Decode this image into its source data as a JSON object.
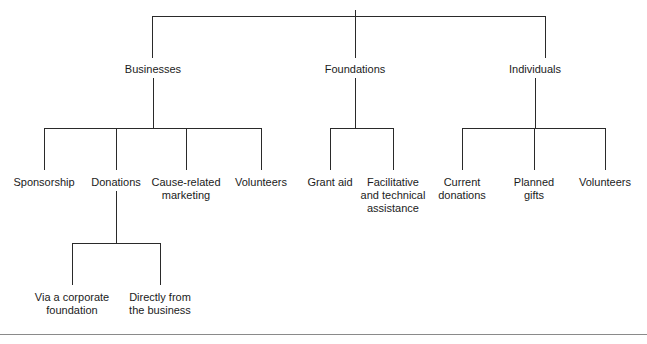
{
  "diagram": {
    "type": "organizational-tree",
    "title": "",
    "orientation": "top-down",
    "line_color": "#2a2a2a",
    "text_color": "#1b1b1b",
    "background_color": "#ffffff",
    "footer_rule_color": "#8a8a8a",
    "levels": 4
  },
  "nodes": {
    "level1": [
      {
        "id": "businesses",
        "label": "Businesses",
        "x": 153,
        "y": 63
      },
      {
        "id": "foundations",
        "label": "Foundations",
        "x": 355,
        "y": 63
      },
      {
        "id": "individuals",
        "label": "Individuals",
        "x": 535,
        "y": 63
      }
    ],
    "level2_businesses": [
      {
        "id": "sponsorship",
        "label": "Sponsorship",
        "x": 44,
        "y": 176
      },
      {
        "id": "donations",
        "label": "Donations",
        "x": 116,
        "y": 176
      },
      {
        "id": "cause-related-marketing",
        "label": "Cause-related\nmarketing",
        "x": 186,
        "y": 176
      },
      {
        "id": "volunteers-business",
        "label": "Volunteers",
        "x": 261,
        "y": 176
      }
    ],
    "level2_foundations": [
      {
        "id": "grant-aid",
        "label": "Grant aid",
        "x": 330,
        "y": 176
      },
      {
        "id": "facilitative-and-technical-assistance",
        "label": "Facilitative\nand technical\nassistance",
        "x": 393,
        "y": 176
      }
    ],
    "level2_individuals": [
      {
        "id": "current-donations",
        "label": "Current\ndonations",
        "x": 462,
        "y": 176
      },
      {
        "id": "planned-gifts",
        "label": "Planned\ngifts",
        "x": 534,
        "y": 176
      },
      {
        "id": "volunteers-individual",
        "label": "Volunteers",
        "x": 605,
        "y": 176
      }
    ],
    "level3_donations": [
      {
        "id": "via-a-corporate-foundation",
        "label": "Via a corporate\nfoundation",
        "x": 72,
        "y": 291
      },
      {
        "id": "directly-from-the-business",
        "label": "Directly from\nthe business",
        "x": 160,
        "y": 291
      }
    ]
  },
  "connectors": {
    "root_bar": {
      "x1": 152,
      "x2": 545,
      "y": 16
    },
    "root_stub": {
      "x": 355,
      "y1": 10,
      "y2": 16
    },
    "root_drops": [
      {
        "x": 152,
        "y1": 16,
        "y2": 58
      },
      {
        "x": 355,
        "y1": 16,
        "y2": 58
      },
      {
        "x": 545,
        "y1": 16,
        "y2": 58
      }
    ],
    "businesses_stem": {
      "x": 153,
      "y1": 78,
      "y2": 128
    },
    "businesses_bar": {
      "x1": 44,
      "x2": 261,
      "y": 128
    },
    "businesses_drops": [
      {
        "x": 44,
        "y1": 128,
        "y2": 170
      },
      {
        "x": 116,
        "y1": 128,
        "y2": 170
      },
      {
        "x": 186,
        "y1": 128,
        "y2": 170
      },
      {
        "x": 261,
        "y1": 128,
        "y2": 170
      }
    ],
    "foundations_stem": {
      "x": 355,
      "y1": 78,
      "y2": 128
    },
    "foundations_bar": {
      "x1": 330,
      "x2": 393,
      "y": 128
    },
    "foundations_drops": [
      {
        "x": 330,
        "y1": 128,
        "y2": 170
      },
      {
        "x": 393,
        "y1": 128,
        "y2": 170
      }
    ],
    "individuals_stem": {
      "x": 535,
      "y1": 78,
      "y2": 128
    },
    "individuals_bar": {
      "x1": 462,
      "x2": 605,
      "y": 128
    },
    "individuals_drops": [
      {
        "x": 462,
        "y1": 128,
        "y2": 170
      },
      {
        "x": 534,
        "y1": 128,
        "y2": 170
      },
      {
        "x": 605,
        "y1": 128,
        "y2": 170
      }
    ],
    "donations_stem": {
      "x": 116,
      "y1": 191,
      "y2": 243
    },
    "donations_bar": {
      "x1": 72,
      "x2": 160,
      "y": 243
    },
    "donations_drops": [
      {
        "x": 72,
        "y1": 243,
        "y2": 285
      },
      {
        "x": 160,
        "y1": 243,
        "y2": 285
      }
    ],
    "footer_rule": {
      "y": 334
    }
  }
}
